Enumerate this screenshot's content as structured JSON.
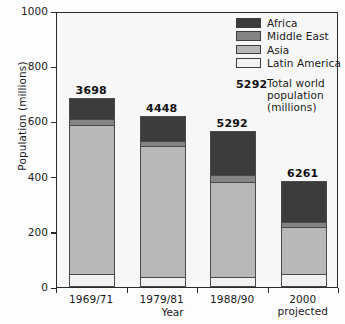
{
  "chart_data": {
    "type": "bar",
    "stacked": true,
    "title": "",
    "xlabel": "Year",
    "ylabel": "Population (millions)",
    "ylim": [
      0,
      1000
    ],
    "yticks": [
      0,
      200,
      400,
      600,
      800,
      1000
    ],
    "grid": false,
    "legend_position": "top-right",
    "categories": [
      "1969/71",
      "1979/81",
      "1988/90",
      "2000 projected"
    ],
    "category_lines": [
      [
        "1969/71"
      ],
      [
        "1979/81"
      ],
      [
        "1988/90"
      ],
      [
        "2000",
        "projected"
      ]
    ],
    "series": [
      {
        "name": "Latin America",
        "color": "#f2f2f0",
        "values": [
          47,
          38,
          37,
          47
        ]
      },
      {
        "name": "Asia",
        "color": "#b8b8b8",
        "values": [
          540,
          473,
          345,
          170
        ]
      },
      {
        "name": "Middle East",
        "color": "#848484",
        "values": [
          23,
          17,
          25,
          18
        ]
      },
      {
        "name": "Africa",
        "color": "#3c3c3c",
        "values": [
          75,
          92,
          158,
          150
        ]
      }
    ],
    "stack_order_bottom_to_top": [
      "Latin America",
      "Asia",
      "Middle East",
      "Africa"
    ],
    "bar_totals": [
      685,
      620,
      565,
      385
    ],
    "bar_value_labels": [
      "3698",
      "4448",
      "5292",
      "6261"
    ],
    "annotation": {
      "value": "5292",
      "text_lines": [
        "Total world",
        "population",
        "(millions)"
      ]
    }
  },
  "legend": {
    "items": [
      {
        "label": "Africa",
        "color": "#3c3c3c"
      },
      {
        "label": "Middle East",
        "color": "#848484"
      },
      {
        "label": "Asia",
        "color": "#b8b8b8"
      },
      {
        "label": "Latin America",
        "color": "#f2f2f0"
      }
    ]
  },
  "axes": {
    "y_ticks": [
      "1000",
      "800",
      "600",
      "400",
      "200",
      "0"
    ],
    "y_title": "Population (millions)",
    "x_title": "Year"
  }
}
